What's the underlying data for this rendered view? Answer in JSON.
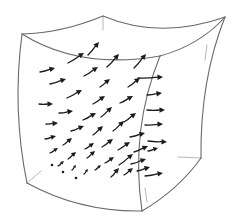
{
  "figure": {
    "colors": {
      "background": "#ffffff",
      "edge": "#6a6a6a",
      "faint_edge": "#b8b8b8",
      "arrow": "#1c1c1c"
    },
    "corners": {
      "top_left": [
        22,
        34
      ],
      "top_back": [
        103,
        16
      ],
      "top_right": [
        225,
        17
      ],
      "front_ridge_top": [
        160,
        56
      ],
      "bottom_left": [
        27,
        183
      ],
      "bottom_front": [
        142,
        211
      ],
      "bottom_right": [
        201,
        158
      ]
    },
    "edges": [
      {
        "name": "top-back-left-edge",
        "d": "M22,34 Q62,33 103,16"
      },
      {
        "name": "top-back-right-edge",
        "d": "M103,16 Q160,40 225,17"
      },
      {
        "name": "top-front-edge",
        "d": "M22,34 Q80,70 160,56"
      },
      {
        "name": "top-right-front-edge",
        "d": "M160,56 Q200,45 225,17"
      },
      {
        "name": "left-edge",
        "d": "M22,34 Q12,110 27,183"
      },
      {
        "name": "front-vertical-edge",
        "d": "M160,56 Q130,130 142,211"
      },
      {
        "name": "right-back-edge",
        "d": "M225,17 Q200,80 201,158"
      },
      {
        "name": "bottom-front-edge",
        "d": "M27,183 Q80,212 142,211"
      },
      {
        "name": "bottom-right-edge",
        "d": "M142,211 Q178,190 201,158"
      }
    ],
    "faint_edges": [
      {
        "name": "hidden-back-vertical-edge",
        "d": "M103,16 L103,30"
      },
      {
        "name": "hidden-bottom-left-edge",
        "d": "M27,183 L41,171"
      },
      {
        "name": "hidden-bottom-right-edge",
        "d": "M201,158 L178,157"
      },
      {
        "name": "hidden-right-inner-stroke",
        "d": "M207,45 L205,60"
      },
      {
        "name": "hidden-front-inner-stroke",
        "d": "M145,188 L147,202"
      }
    ],
    "arrows": [
      {
        "x1": 88,
        "y1": 55,
        "x2": 99,
        "y2": 42
      },
      {
        "x1": 68,
        "y1": 63,
        "x2": 84,
        "y2": 53
      },
      {
        "x1": 107,
        "y1": 67,
        "x2": 119,
        "y2": 54
      },
      {
        "x1": 134,
        "y1": 68,
        "x2": 146,
        "y2": 54
      },
      {
        "x1": 40,
        "y1": 72,
        "x2": 55,
        "y2": 68
      },
      {
        "x1": 84,
        "y1": 76,
        "x2": 98,
        "y2": 67
      },
      {
        "x1": 100,
        "y1": 87,
        "x2": 110,
        "y2": 79
      },
      {
        "x1": 128,
        "y1": 87,
        "x2": 140,
        "y2": 78
      },
      {
        "x1": 50,
        "y1": 84,
        "x2": 66,
        "y2": 79
      },
      {
        "x1": 138,
        "y1": 78,
        "x2": 163,
        "y2": 77
      },
      {
        "x1": 67,
        "y1": 98,
        "x2": 82,
        "y2": 90
      },
      {
        "x1": 93,
        "y1": 104,
        "x2": 105,
        "y2": 96
      },
      {
        "x1": 120,
        "y1": 103,
        "x2": 133,
        "y2": 96
      },
      {
        "x1": 39,
        "y1": 104,
        "x2": 53,
        "y2": 104
      },
      {
        "x1": 147,
        "y1": 95,
        "x2": 162,
        "y2": 93
      },
      {
        "x1": 147,
        "y1": 110,
        "x2": 165,
        "y2": 110
      },
      {
        "x1": 59,
        "y1": 113,
        "x2": 73,
        "y2": 111
      },
      {
        "x1": 83,
        "y1": 120,
        "x2": 96,
        "y2": 113
      },
      {
        "x1": 101,
        "y1": 117,
        "x2": 112,
        "y2": 107
      },
      {
        "x1": 124,
        "y1": 122,
        "x2": 136,
        "y2": 113
      },
      {
        "x1": 46,
        "y1": 124,
        "x2": 58,
        "y2": 123
      },
      {
        "x1": 71,
        "y1": 131,
        "x2": 84,
        "y2": 126
      },
      {
        "x1": 93,
        "y1": 135,
        "x2": 103,
        "y2": 126
      },
      {
        "x1": 113,
        "y1": 131,
        "x2": 124,
        "y2": 121
      },
      {
        "x1": 130,
        "y1": 137,
        "x2": 145,
        "y2": 133
      },
      {
        "x1": 145,
        "y1": 125,
        "x2": 163,
        "y2": 124
      },
      {
        "x1": 148,
        "y1": 141,
        "x2": 167,
        "y2": 142
      },
      {
        "x1": 45,
        "y1": 139,
        "x2": 56,
        "y2": 136
      },
      {
        "x1": 63,
        "y1": 145,
        "x2": 72,
        "y2": 138
      },
      {
        "x1": 85,
        "y1": 149,
        "x2": 94,
        "y2": 143
      },
      {
        "x1": 102,
        "y1": 147,
        "x2": 113,
        "y2": 139
      },
      {
        "x1": 118,
        "y1": 150,
        "x2": 130,
        "y2": 142
      },
      {
        "x1": 148,
        "y1": 151,
        "x2": 158,
        "y2": 148
      },
      {
        "x1": 134,
        "y1": 152,
        "x2": 148,
        "y2": 146
      },
      {
        "x1": 50,
        "y1": 153,
        "x2": 58,
        "y2": 148
      },
      {
        "x1": 68,
        "y1": 159,
        "x2": 76,
        "y2": 152
      },
      {
        "x1": 87,
        "y1": 158,
        "x2": 95,
        "y2": 151
      },
      {
        "x1": 105,
        "y1": 163,
        "x2": 114,
        "y2": 157
      },
      {
        "x1": 119,
        "y1": 165,
        "x2": 133,
        "y2": 154
      },
      {
        "x1": 137,
        "y1": 171,
        "x2": 150,
        "y2": 167
      },
      {
        "x1": 131,
        "y1": 164,
        "x2": 146,
        "y2": 159
      },
      {
        "x1": 58,
        "y1": 166,
        "x2": 64,
        "y2": 161
      },
      {
        "x1": 72,
        "y1": 170,
        "x2": 76,
        "y2": 165
      },
      {
        "x1": 84,
        "y1": 174,
        "x2": 88,
        "y2": 169
      },
      {
        "x1": 95,
        "y1": 170,
        "x2": 101,
        "y2": 165
      },
      {
        "x1": 111,
        "y1": 177,
        "x2": 119,
        "y2": 168
      },
      {
        "x1": 124,
        "y1": 175,
        "x2": 133,
        "y2": 168
      },
      {
        "x1": 145,
        "y1": 176,
        "x2": 163,
        "y2": 173
      }
    ],
    "dots": [
      {
        "cx": 52,
        "cy": 165
      },
      {
        "cx": 63,
        "cy": 172
      },
      {
        "cx": 76,
        "cy": 178
      }
    ]
  }
}
